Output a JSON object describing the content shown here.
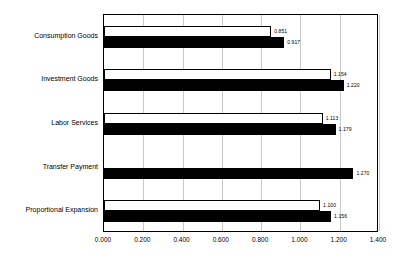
{
  "chart_data": {
    "type": "bar",
    "orientation": "horizontal",
    "title": "",
    "xlabel": "",
    "ylabel": "",
    "xlim": [
      0.0,
      1.4
    ],
    "xticks": [
      "0.000",
      "0.200",
      "0.400",
      "0.600",
      "0.800",
      "1.000",
      "1.200",
      "1.400"
    ],
    "xtick_values": [
      0.0,
      0.2,
      0.4,
      0.6,
      0.8,
      1.0,
      1.2,
      1.4
    ],
    "grid": true,
    "legend_position": "top-right-inside",
    "categories": [
      "Consumption Goods",
      "Investment Goods",
      "Labor Services",
      "Transfer Payment",
      "Proportional Expansion"
    ],
    "series": [
      {
        "name": "Separable",
        "color": "#ffffff",
        "edge_color": "#000000",
        "values": [
          0.851,
          1.154,
          1.113,
          null,
          1.1
        ],
        "labels": [
          "0.851",
          "1.154",
          "1.113",
          "",
          "1.100"
        ]
      },
      {
        "name": "Substitute",
        "color": "#000000",
        "edge_color": "#000000",
        "values": [
          0.917,
          1.22,
          1.179,
          1.27,
          1.156
        ],
        "labels": [
          "0.917",
          "1.220",
          "1.179",
          "1.270",
          "1.156"
        ]
      }
    ]
  },
  "legend": {
    "items": [
      {
        "label": "Separable",
        "swatch": "open-square-icon"
      },
      {
        "label": "Substitute",
        "swatch": "filled-square-icon"
      }
    ]
  }
}
